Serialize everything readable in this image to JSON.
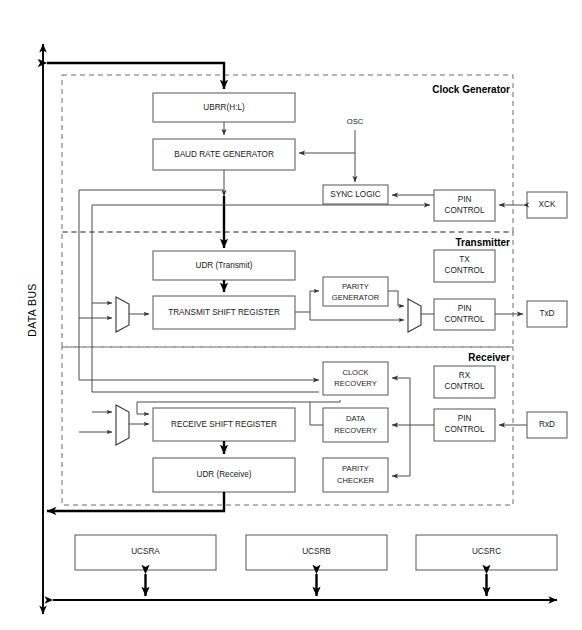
{
  "diagram": {
    "bus": {
      "label": "DATA BUS"
    },
    "groups": [
      {
        "id": "clock-generator",
        "label": "Clock Generator"
      },
      {
        "id": "transmitter",
        "label": "Transmitter"
      },
      {
        "id": "receiver",
        "label": "Receiver"
      }
    ],
    "blocks": {
      "ubrr": {
        "label": "UBRR(H:L)"
      },
      "baud_rate_generator": {
        "label": "BAUD RATE GENERATOR"
      },
      "sync_logic": {
        "label": "SYNC LOGIC"
      },
      "clock_pin_control": {
        "label_line1": "PIN",
        "label_line2": "CONTROL"
      },
      "xck": {
        "label": "XCK"
      },
      "osc": {
        "label": "OSC"
      },
      "udr_transmit": {
        "label": "UDR (Transmit)"
      },
      "transmit_shift_register": {
        "label": "TRANSMIT SHIFT REGISTER"
      },
      "parity_generator": {
        "label_line1": "PARITY",
        "label_line2": "GENERATOR"
      },
      "tx_control": {
        "label_line1": "TX",
        "label_line2": "CONTROL"
      },
      "tx_pin_control": {
        "label_line1": "PIN",
        "label_line2": "CONTROL"
      },
      "txd": {
        "label": "TxD"
      },
      "clock_recovery": {
        "label_line1": "CLOCK",
        "label_line2": "RECOVERY"
      },
      "data_recovery": {
        "label_line1": "DATA",
        "label_line2": "RECOVERY"
      },
      "parity_checker": {
        "label_line1": "PARITY",
        "label_line2": "CHECKER"
      },
      "rx_control": {
        "label_line1": "RX",
        "label_line2": "CONTROL"
      },
      "rx_pin_control": {
        "label_line1": "PIN",
        "label_line2": "CONTROL"
      },
      "rxd": {
        "label": "RxD"
      },
      "receive_shift_register": {
        "label": "RECEIVE SHIFT REGISTER"
      },
      "udr_receive": {
        "label": "UDR (Receive)"
      },
      "ucsra": {
        "label": "UCSRA"
      },
      "ucsrb": {
        "label": "UCSRB"
      },
      "ucsrc": {
        "label": "UCSRC"
      }
    },
    "colors": {
      "block_stroke": "#555555",
      "group_stroke": "#6a6a6a",
      "wire": "#4a4a4a",
      "bus": "#000000",
      "background": "#ffffff",
      "text": "#1a1a1a"
    }
  }
}
